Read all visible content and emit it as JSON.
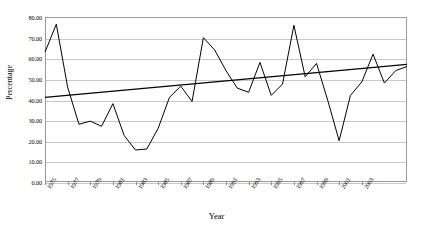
{
  "chart_data": {
    "type": "line",
    "title": "",
    "xlabel": "Year",
    "ylabel": "Percentage",
    "xlim": [
      1975,
      2004
    ],
    "ylim": [
      0,
      80
    ],
    "grid": true,
    "legend": "none",
    "y_ticks": [
      "0.00",
      "10.00",
      "20.00",
      "30.00",
      "40.00",
      "50.00",
      "60.00",
      "70.00",
      "80.00"
    ],
    "y_tick_values": [
      0,
      10,
      20,
      30,
      40,
      50,
      60,
      70,
      80
    ],
    "x_tick_labels": [
      "1975",
      "1977",
      "1979",
      "1981",
      "1983",
      "1985",
      "1987",
      "1989",
      "1991",
      "1993",
      "1995",
      "1997",
      "1999",
      "2001",
      "2003"
    ],
    "x_tick_values": [
      1975,
      1977,
      1979,
      1981,
      1983,
      1985,
      1987,
      1989,
      1991,
      1993,
      1995,
      1997,
      1999,
      2001,
      2003
    ],
    "x": [
      1975,
      1976,
      1977,
      1978,
      1979,
      1980,
      1981,
      1982,
      1983,
      1984,
      1985,
      1986,
      1987,
      1988,
      1989,
      1990,
      1991,
      1992,
      1993,
      1994,
      1995,
      1996,
      1997,
      1998,
      1999,
      2000,
      2001,
      2002,
      2003,
      2004
    ],
    "series": [
      {
        "name": "Percentage",
        "color": "#000000",
        "values": [
          63.0,
          76.5,
          46.0,
          28.0,
          29.5,
          27.0,
          38.0,
          22.5,
          15.5,
          16.0,
          26.0,
          41.0,
          46.5,
          39.0,
          70.0,
          64.0,
          54.0,
          45.5,
          43.5,
          58.0,
          42.0,
          47.5,
          76.0,
          51.0,
          57.5,
          39.5,
          20.0,
          42.0,
          48.5,
          62.0
        ]
      },
      {
        "name": "Linear trend",
        "color": "#000000",
        "trend": true,
        "start_value": 41.0,
        "end_value": 57.0
      }
    ],
    "tail_values": [
      48.0,
      54.0,
      56.0
    ],
    "full_values": [
      63.0,
      76.5,
      46.0,
      28.0,
      29.5,
      27.0,
      38.0,
      22.5,
      15.5,
      16.0,
      26.0,
      41.0,
      46.5,
      39.0,
      70.0,
      64.0,
      54.0,
      45.5,
      43.5,
      58.0,
      42.0,
      47.5,
      76.0,
      51.0,
      57.5,
      39.5,
      20.0,
      42.0,
      48.5,
      62.0,
      48.0,
      54.0,
      56.0
    ]
  }
}
